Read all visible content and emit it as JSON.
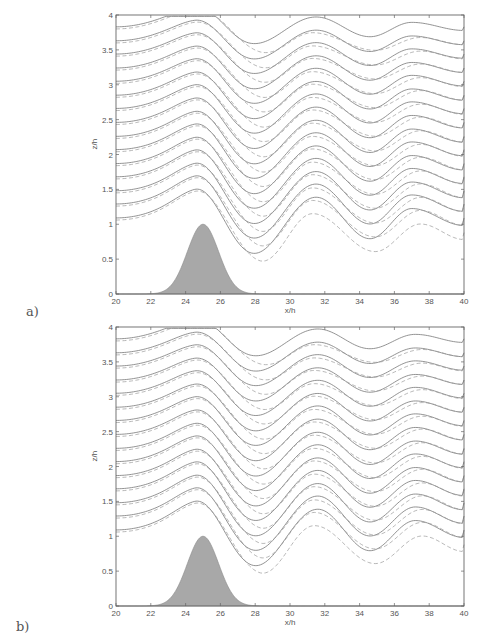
{
  "chart_data": [
    {
      "type": "line",
      "panel_label": "a)",
      "title": "",
      "xlabel": "x/h",
      "ylabel": "z/h",
      "xlim": [
        20,
        40
      ],
      "ylim": [
        0,
        4
      ],
      "xticks": [
        "20",
        "22",
        "24",
        "26",
        "28",
        "30",
        "32",
        "34",
        "36",
        "38",
        "40"
      ],
      "yticks": [
        "0",
        "0.5",
        "1",
        "1.5",
        "2",
        "2.5",
        "3",
        "3.5",
        "4"
      ],
      "grid": false,
      "legend": null,
      "topography": {
        "type": "gaussian",
        "center": 25,
        "height": 1.0,
        "width_sigma": 0.9,
        "fill": "#a8a8a8"
      },
      "series": [
        {
          "name": "streamlines (solid)",
          "style": "solid",
          "color": "#777777",
          "upstream_heights": [
            1.09,
            1.29,
            1.48,
            1.68,
            1.87,
            2.07,
            2.26,
            2.46,
            2.66,
            2.85,
            3.05,
            3.24,
            3.44,
            3.63,
            3.83
          ],
          "lee_wave": {
            "trough1_x": 27.8,
            "crest1_x": 31.5,
            "trough2_x": 34.6,
            "crest2_x": 37.0,
            "amplitude_bottom": 0.55,
            "amplitude_top": 0.25
          }
        },
        {
          "name": "streamlines (dashed)",
          "style": "dashed",
          "color": "#999999",
          "upstream_heights": [
            1.09,
            1.29,
            1.48,
            1.68,
            1.87,
            2.07,
            2.26,
            2.46,
            2.66,
            2.85,
            3.05,
            3.24,
            3.44,
            3.63,
            3.83
          ],
          "lee_wave": {
            "trough1_x": 28.2,
            "crest1_x": 31.3,
            "trough2_x": 34.9,
            "crest2_x": 37.5,
            "amplitude_bottom": 0.5,
            "amplitude_top": 0.22,
            "offset_descent": 0.18
          }
        }
      ]
    },
    {
      "type": "line",
      "panel_label": "b)",
      "title": "",
      "xlabel": "x/h",
      "ylabel": "z/h",
      "xlim": [
        20,
        40
      ],
      "ylim": [
        0,
        4
      ],
      "xticks": [
        "20",
        "22",
        "24",
        "26",
        "28",
        "30",
        "32",
        "34",
        "36",
        "38",
        "40"
      ],
      "yticks": [
        "0",
        "0.5",
        "1",
        "1.5",
        "2",
        "2.5",
        "3",
        "3.5",
        "4"
      ],
      "grid": false,
      "legend": null,
      "topography": {
        "type": "gaussian",
        "center": 25,
        "height": 1.0,
        "width_sigma": 0.9,
        "fill": "#a8a8a8"
      },
      "series": [
        {
          "name": "streamlines (solid)",
          "style": "solid",
          "color": "#777777",
          "upstream_heights": [
            1.09,
            1.29,
            1.48,
            1.68,
            1.87,
            2.07,
            2.26,
            2.46,
            2.66,
            2.85,
            3.05,
            3.24,
            3.44,
            3.63,
            3.83
          ],
          "lee_wave": {
            "trough1_x": 27.9,
            "crest1_x": 31.6,
            "trough2_x": 34.6,
            "crest2_x": 37.2,
            "amplitude_bottom": 0.55,
            "amplitude_top": 0.25
          }
        },
        {
          "name": "streamlines (dashed)",
          "style": "dashed",
          "color": "#999999",
          "upstream_heights": [
            1.09,
            1.29,
            1.48,
            1.68,
            1.87,
            2.07,
            2.26,
            2.46,
            2.66,
            2.85,
            3.05,
            3.24,
            3.44,
            3.63,
            3.83
          ],
          "lee_wave": {
            "trough1_x": 28.2,
            "crest1_x": 31.4,
            "trough2_x": 34.9,
            "crest2_x": 37.6,
            "amplitude_bottom": 0.5,
            "amplitude_top": 0.22,
            "offset_descent": 0.18
          }
        }
      ]
    }
  ],
  "panels": [
    {
      "label": "a)",
      "xlabel": "x/h",
      "ylabel": "z/h"
    },
    {
      "label": "b)",
      "xlabel": "x/h",
      "ylabel": "z/h"
    }
  ]
}
